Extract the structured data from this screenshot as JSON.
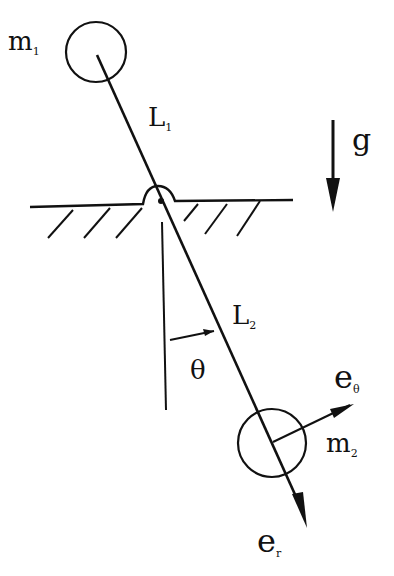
{
  "diagram": {
    "labels": {
      "m1": {
        "main": "m",
        "sub": "1"
      },
      "m2": {
        "main": "m",
        "sub": "2"
      },
      "L1": {
        "main": "L",
        "sub": "1"
      },
      "L2": {
        "main": "L",
        "sub": "2"
      },
      "g": "g",
      "theta": "θ",
      "e_theta": {
        "main": "e",
        "sub": "θ"
      },
      "e_r": {
        "main": "e",
        "sub": "r"
      }
    },
    "colors": {
      "stroke": "#111111",
      "background": "#ffffff"
    }
  }
}
